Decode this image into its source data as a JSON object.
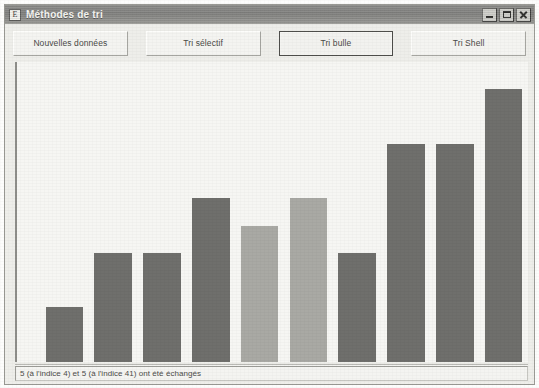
{
  "window": {
    "title": "Méthodes de tri",
    "icon": "app-icon",
    "controls": {
      "minimize_label": "Minimiser",
      "maximize_label": "Agrandir",
      "close_label": "Fermer"
    }
  },
  "toolbar": {
    "buttons": [
      {
        "label": "Nouvelles données",
        "focused": false
      },
      {
        "label": "Tri sélectif",
        "focused": false
      },
      {
        "label": "Tri bulle",
        "focused": true
      },
      {
        "label": "Tri Shell",
        "focused": false
      }
    ]
  },
  "statusbar": {
    "message": "5 (à l'indice 4) et 5 (à l'indice 41) ont été échangés"
  },
  "colors": {
    "bar": "#6f6f6c",
    "bar_highlight": "#a9a9a4",
    "canvas": "#f6f6f3",
    "window_face": "#eeeeea",
    "titlebar": "#8b8b88"
  },
  "chart_data": {
    "type": "bar",
    "title": "",
    "xlabel": "",
    "ylabel": "",
    "grid": false,
    "legend": "none",
    "ylim": [
      0,
      100
    ],
    "categories": [
      "0",
      "1",
      "2",
      "3",
      "4",
      "5",
      "6",
      "7",
      "8",
      "9"
    ],
    "values": [
      20,
      40,
      40,
      60,
      50,
      60,
      40,
      80,
      80,
      100
    ],
    "highlighted_indices": [
      4,
      5
    ],
    "series": [
      {
        "name": "valeurs",
        "values": [
          20,
          40,
          40,
          60,
          50,
          60,
          40,
          80,
          80,
          100
        ]
      }
    ]
  }
}
